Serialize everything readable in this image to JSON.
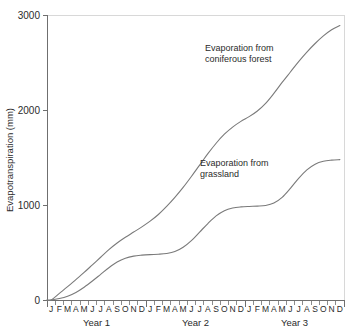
{
  "chart_data": {
    "type": "line",
    "title": "",
    "xlabel": "",
    "ylabel": "Evapotranspiration (mm)",
    "ylim": [
      0,
      3000
    ],
    "yticks": [
      0,
      1000,
      2000,
      3000
    ],
    "ytick_labels": [
      "0",
      "1000",
      "2000",
      "3000"
    ],
    "grid": false,
    "legend_position": "inline-annotation",
    "x_group_labels": [
      "Year 1",
      "Year 2",
      "Year 3"
    ],
    "categories": [
      "J",
      "F",
      "M",
      "A",
      "M",
      "J",
      "J",
      "A",
      "S",
      "O",
      "N",
      "D",
      "J",
      "F",
      "M",
      "A",
      "M",
      "J",
      "J",
      "A",
      "S",
      "O",
      "N",
      "D",
      "J",
      "F",
      "M",
      "A",
      "M",
      "J",
      "J",
      "A",
      "S",
      "O",
      "N",
      "D"
    ],
    "series": [
      {
        "name": "Evaporation from coniferous forest",
        "color": "#7a7a7a",
        "label_lines": [
          "Evaporation from",
          "coniferous forest"
        ],
        "values": [
          0,
          70,
          140,
          215,
          290,
          370,
          450,
          530,
          600,
          660,
          715,
          770,
          830,
          900,
          985,
          1080,
          1185,
          1300,
          1420,
          1540,
          1650,
          1745,
          1820,
          1880,
          1930,
          1990,
          2070,
          2175,
          2290,
          2400,
          2510,
          2610,
          2700,
          2780,
          2845,
          2890
        ]
      },
      {
        "name": "Evaporation from grassland",
        "color": "#7a7a7a",
        "label_lines": [
          "Evaporation from",
          "grassland"
        ],
        "values": [
          0,
          15,
          40,
          80,
          135,
          200,
          270,
          340,
          400,
          440,
          462,
          472,
          478,
          482,
          490,
          510,
          555,
          625,
          715,
          805,
          885,
          940,
          968,
          980,
          985,
          988,
          995,
          1020,
          1080,
          1175,
          1280,
          1370,
          1430,
          1460,
          1472,
          1478
        ]
      }
    ],
    "annotations": [
      {
        "id": "coniferous-label",
        "lines": [
          "Evaporation from",
          "coniferous forest"
        ],
        "x": 205,
        "y": 51
      },
      {
        "id": "grassland-label",
        "lines": [
          "Evaporation from",
          "grassland"
        ],
        "x": 200,
        "y": 166
      }
    ]
  }
}
